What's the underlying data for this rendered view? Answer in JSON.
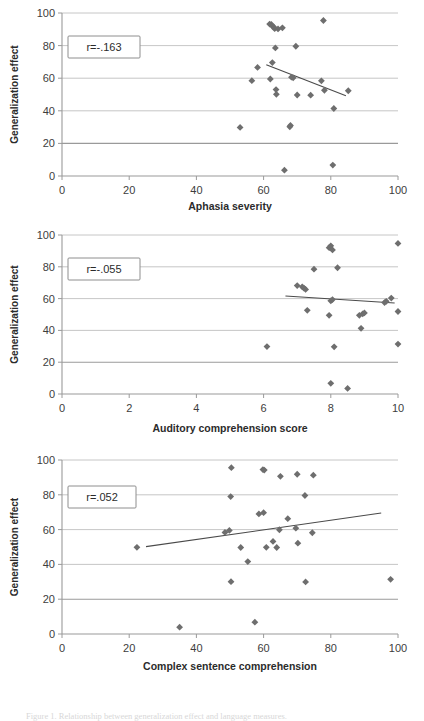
{
  "figure": {
    "caption": "Figure 1. Relationship between generalization effect and language measures."
  },
  "charts": [
    {
      "id": "chart-1",
      "annotation": "r=-.163",
      "ylabel": "Generalization effect",
      "xlabel": "Aphasia severity",
      "chart_data": {
        "type": "scatter",
        "title": "",
        "xlabel": "Aphasia severity",
        "ylabel": "Generalization effect",
        "xlim": [
          0,
          100
        ],
        "ylim": [
          0,
          100
        ],
        "xticks": [
          0,
          20,
          40,
          60,
          80,
          100
        ],
        "yticks": [
          0,
          20,
          40,
          60,
          80,
          100
        ],
        "grid": true,
        "annotation": "r=-.163",
        "correlation": -0.163,
        "legend": "none",
        "points": [
          {
            "x": 53.0,
            "y": 29.8
          },
          {
            "x": 56.5,
            "y": 58.5
          },
          {
            "x": 58.2,
            "y": 66.6
          },
          {
            "x": 61.8,
            "y": 93.2
          },
          {
            "x": 62.3,
            "y": 93.0
          },
          {
            "x": 62.6,
            "y": 92.0
          },
          {
            "x": 63.0,
            "y": 91.4
          },
          {
            "x": 63.3,
            "y": 90.4
          },
          {
            "x": 64.3,
            "y": 90.2
          },
          {
            "x": 65.6,
            "y": 90.9
          },
          {
            "x": 62.0,
            "y": 59.5
          },
          {
            "x": 62.6,
            "y": 69.6
          },
          {
            "x": 63.5,
            "y": 78.6
          },
          {
            "x": 63.7,
            "y": 53.0
          },
          {
            "x": 63.8,
            "y": 50.1
          },
          {
            "x": 66.2,
            "y": 3.6
          },
          {
            "x": 67.8,
            "y": 30.2
          },
          {
            "x": 68.0,
            "y": 31.0
          },
          {
            "x": 68.3,
            "y": 60.6
          },
          {
            "x": 68.8,
            "y": 60.2
          },
          {
            "x": 69.6,
            "y": 79.6
          },
          {
            "x": 70.0,
            "y": 49.7
          },
          {
            "x": 74.0,
            "y": 49.6
          },
          {
            "x": 77.2,
            "y": 58.4
          },
          {
            "x": 77.8,
            "y": 95.4
          },
          {
            "x": 78.1,
            "y": 52.6
          },
          {
            "x": 80.6,
            "y": 6.7
          },
          {
            "x": 80.9,
            "y": 41.4
          },
          {
            "x": 85.2,
            "y": 52.3
          }
        ],
        "trendline": {
          "x1": 60.8,
          "y1": 68.2,
          "x2": 84.5,
          "y2": 49.2
        }
      }
    },
    {
      "id": "chart-2",
      "annotation": "r=-.055",
      "ylabel": "Generalization effect",
      "xlabel": "Auditory comprehension score",
      "chart_data": {
        "type": "scatter",
        "title": "",
        "xlabel": "Auditory comprehension score",
        "ylabel": "Generalization effect",
        "xlim": [
          0,
          10
        ],
        "ylim": [
          0,
          100
        ],
        "xticks": [
          0,
          2,
          4,
          6,
          8,
          10
        ],
        "yticks": [
          0,
          20,
          40,
          60,
          80,
          100
        ],
        "grid": true,
        "annotation": "r=-.055",
        "correlation": -0.055,
        "legend": "none",
        "points": [
          {
            "x": 6.1,
            "y": 29.8
          },
          {
            "x": 7.0,
            "y": 68.2
          },
          {
            "x": 7.15,
            "y": 67.4
          },
          {
            "x": 7.2,
            "y": 66.6
          },
          {
            "x": 7.25,
            "y": 65.8
          },
          {
            "x": 7.3,
            "y": 52.6
          },
          {
            "x": 7.5,
            "y": 78.5
          },
          {
            "x": 7.95,
            "y": 92.0
          },
          {
            "x": 8.0,
            "y": 93.2
          },
          {
            "x": 8.05,
            "y": 90.6
          },
          {
            "x": 8.0,
            "y": 58.6
          },
          {
            "x": 8.05,
            "y": 59.4
          },
          {
            "x": 7.95,
            "y": 49.5
          },
          {
            "x": 8.0,
            "y": 6.7
          },
          {
            "x": 8.2,
            "y": 79.4
          },
          {
            "x": 8.1,
            "y": 29.7
          },
          {
            "x": 8.5,
            "y": 3.5
          },
          {
            "x": 8.85,
            "y": 49.5
          },
          {
            "x": 8.95,
            "y": 50.4
          },
          {
            "x": 9.0,
            "y": 51.0
          },
          {
            "x": 8.9,
            "y": 41.3
          },
          {
            "x": 9.6,
            "y": 57.5
          },
          {
            "x": 9.65,
            "y": 58.3
          },
          {
            "x": 9.8,
            "y": 60.3
          },
          {
            "x": 10.0,
            "y": 94.7
          },
          {
            "x": 10.0,
            "y": 51.9
          },
          {
            "x": 10.0,
            "y": 31.4
          }
        ],
        "trendline": {
          "x1": 6.65,
          "y1": 61.6,
          "x2": 9.9,
          "y2": 57.2
        }
      }
    },
    {
      "id": "chart-3",
      "annotation": "r=.052",
      "ylabel": "Generalization effect",
      "xlabel": "Complex sentence comprehension",
      "chart_data": {
        "type": "scatter",
        "title": "",
        "xlabel": "Complex sentence comprehension",
        "ylabel": "Generalization effect",
        "xlim": [
          0,
          100
        ],
        "ylim": [
          0,
          100
        ],
        "xticks": [
          0,
          20,
          40,
          60,
          80,
          100
        ],
        "yticks": [
          0,
          20,
          40,
          60,
          80,
          100
        ],
        "grid": true,
        "annotation": "r=.052",
        "correlation": 0.052,
        "legend": "none",
        "points": [
          {
            "x": 22.3,
            "y": 49.8
          },
          {
            "x": 35.0,
            "y": 3.9
          },
          {
            "x": 48.5,
            "y": 58.4
          },
          {
            "x": 49.8,
            "y": 59.5
          },
          {
            "x": 50.4,
            "y": 95.6
          },
          {
            "x": 50.2,
            "y": 79.0
          },
          {
            "x": 50.3,
            "y": 30.1
          },
          {
            "x": 53.2,
            "y": 49.7
          },
          {
            "x": 55.3,
            "y": 41.6
          },
          {
            "x": 57.4,
            "y": 6.8
          },
          {
            "x": 58.6,
            "y": 69.0
          },
          {
            "x": 59.8,
            "y": 94.5
          },
          {
            "x": 60.2,
            "y": 94.2
          },
          {
            "x": 60.0,
            "y": 69.7
          },
          {
            "x": 60.8,
            "y": 49.8
          },
          {
            "x": 62.8,
            "y": 53.2
          },
          {
            "x": 64.7,
            "y": 59.9
          },
          {
            "x": 65.0,
            "y": 90.6
          },
          {
            "x": 63.9,
            "y": 49.7
          },
          {
            "x": 67.2,
            "y": 66.3
          },
          {
            "x": 69.6,
            "y": 60.8
          },
          {
            "x": 70.0,
            "y": 91.8
          },
          {
            "x": 70.2,
            "y": 52.2
          },
          {
            "x": 72.3,
            "y": 79.6
          },
          {
            "x": 72.5,
            "y": 29.9
          },
          {
            "x": 74.8,
            "y": 91.3
          },
          {
            "x": 74.5,
            "y": 58.2
          },
          {
            "x": 97.8,
            "y": 31.4
          }
        ],
        "trendline": {
          "x1": 25.0,
          "y1": 50.2,
          "x2": 95.0,
          "y2": 69.5
        }
      }
    }
  ]
}
